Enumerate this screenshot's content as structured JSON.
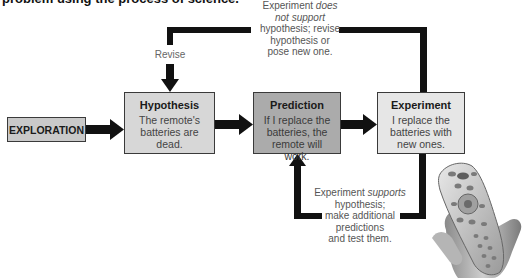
{
  "caption": "problem using the process of science.",
  "nodes": {
    "exploration": {
      "label": "EXPLORATION",
      "fill": "#c9c9c9"
    },
    "hypothesis": {
      "title": "Hypothesis",
      "body": "The remote's batteries are dead.",
      "fill": "#d7d7d7"
    },
    "prediction": {
      "title": "Prediction",
      "body": "If I replace the batteries, the remote will work.",
      "fill": "#ababab"
    },
    "experiment": {
      "title": "Experiment",
      "body": "I replace the batteries with new ones.",
      "fill": "#e6e6e6"
    }
  },
  "edges": [
    {
      "from": "exploration",
      "to": "hypothesis",
      "label": ""
    },
    {
      "from": "hypothesis",
      "to": "prediction",
      "label": ""
    },
    {
      "from": "prediction",
      "to": "experiment",
      "label": ""
    },
    {
      "from": "experiment",
      "to": "hypothesis",
      "label": "Revise"
    },
    {
      "from": "experiment",
      "to": "prediction",
      "label": ""
    }
  ],
  "notes": {
    "top": {
      "line1_pre": "Experiment ",
      "line1_em": "does",
      "line2_em": "not support",
      "line3": "hypothesis; revise",
      "line4": "hypothesis or",
      "line5": "pose new one."
    },
    "revise": "Revise",
    "bottom": {
      "line1_pre": "Experiment ",
      "line1_em": "supports",
      "line2": "hypothesis;",
      "line3": "make additional",
      "line4": "predictions",
      "line5": "and test them."
    }
  },
  "illustration": {
    "subject": "hand-holding-remote-control"
  },
  "colors": {
    "line": "#111111",
    "border": "#3a3a3a"
  }
}
